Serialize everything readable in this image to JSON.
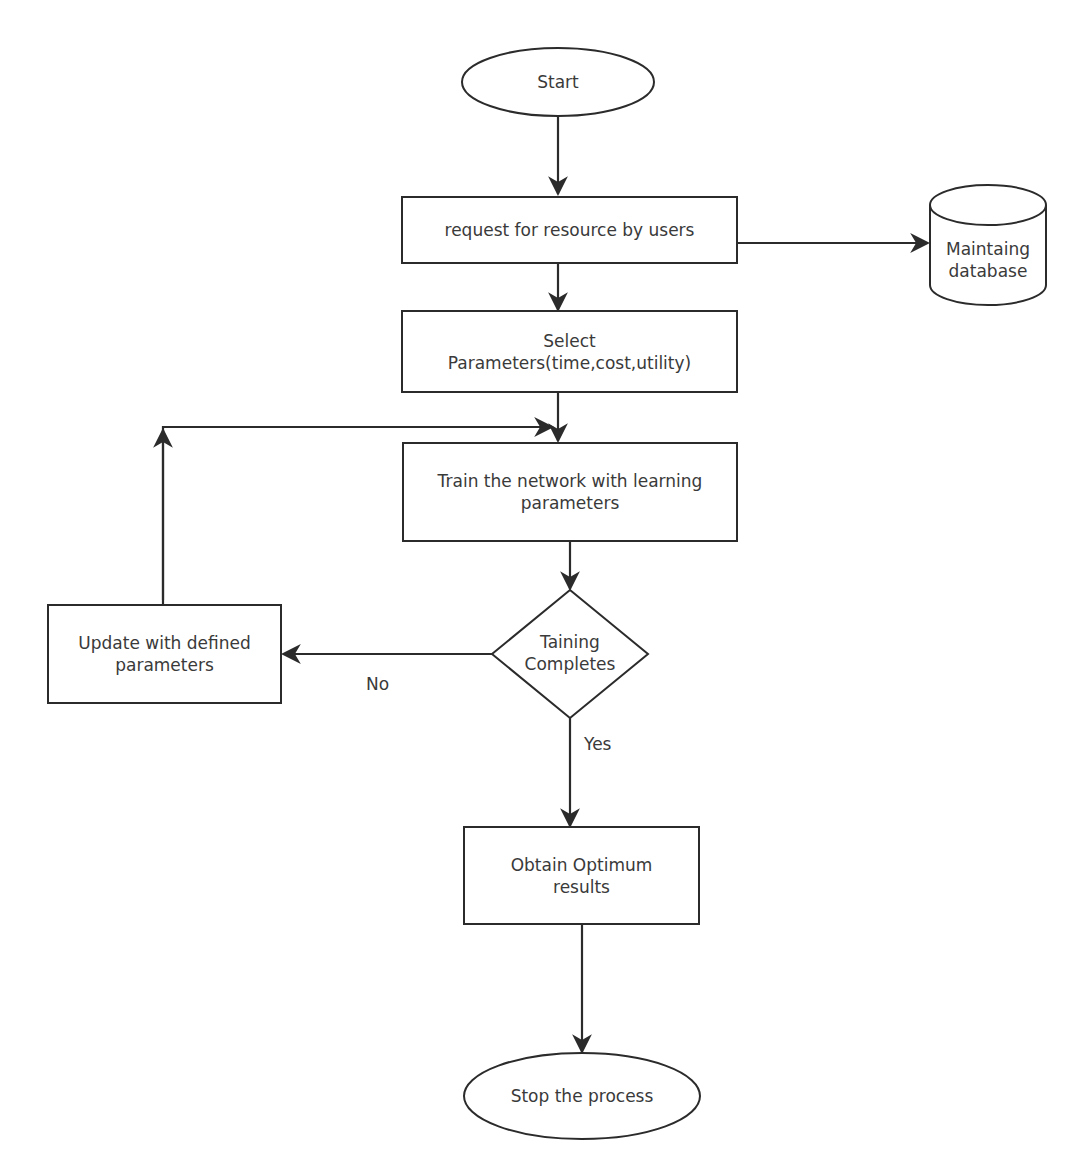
{
  "diagram": {
    "type": "flowchart",
    "nodes": {
      "start": {
        "label": "Start",
        "shape": "ellipse"
      },
      "request": {
        "label": "request for resource by users",
        "shape": "rectangle"
      },
      "database": {
        "label_line1": "Maintaing",
        "label_line2": "database",
        "shape": "cylinder"
      },
      "select": {
        "label_line1": "Select",
        "label_line2": "Parameters(time,cost,utility)",
        "shape": "rectangle"
      },
      "train": {
        "label_line1": "Train the network with learning",
        "label_line2": "parameters",
        "shape": "rectangle"
      },
      "decision": {
        "label_line1": "Taining",
        "label_line2": "Completes",
        "shape": "diamond"
      },
      "update": {
        "label_line1": "Update with defined",
        "label_line2": "parameters",
        "shape": "rectangle"
      },
      "obtain": {
        "label_line1": "Obtain Optimum",
        "label_line2": "results",
        "shape": "rectangle"
      },
      "stop": {
        "label": "Stop the process",
        "shape": "ellipse"
      }
    },
    "edge_labels": {
      "no": "No",
      "yes": "Yes"
    },
    "edges": [
      {
        "from": "start",
        "to": "request"
      },
      {
        "from": "request",
        "to": "database"
      },
      {
        "from": "request",
        "to": "select"
      },
      {
        "from": "select",
        "to": "train"
      },
      {
        "from": "train",
        "to": "decision"
      },
      {
        "from": "decision",
        "to": "update",
        "label": "No"
      },
      {
        "from": "update",
        "to": "train"
      },
      {
        "from": "decision",
        "to": "obtain",
        "label": "Yes"
      },
      {
        "from": "obtain",
        "to": "stop"
      }
    ],
    "colors": {
      "stroke": "#2b2b2b",
      "text": "#3a3a3a",
      "background": "#ffffff"
    }
  }
}
